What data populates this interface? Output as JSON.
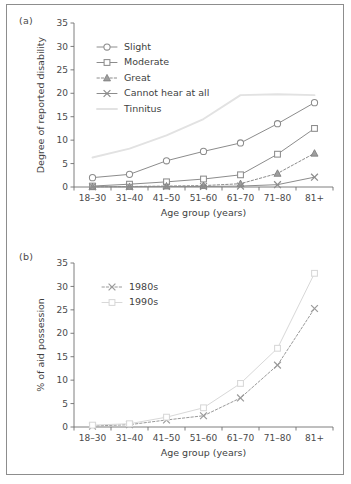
{
  "figure": {
    "panel_a_label": "(a)",
    "panel_b_label": "(b)"
  },
  "chart_data": [
    {
      "id": "panel-a",
      "type": "line",
      "title": "",
      "panel": "(a)",
      "xlabel": "Age group (years)",
      "ylabel": "Degree of reported disability",
      "categories": [
        "18–30",
        "31–40",
        "41–50",
        "51–60",
        "61–70",
        "71–80",
        "81+"
      ],
      "ylim": [
        0,
        35
      ],
      "yticks": [
        0,
        5,
        10,
        15,
        20,
        25,
        30,
        35
      ],
      "yticklabels": [
        "0",
        "5",
        "10",
        "15",
        "20",
        "25",
        "30",
        "35"
      ],
      "grid": false,
      "legend_position": "upper-left-inside",
      "series": [
        {
          "name": "Slight",
          "marker": "circle-open",
          "linestyle": "solid",
          "color": "#8c8c8c",
          "values": [
            2.0,
            2.7,
            5.6,
            7.6,
            9.4,
            13.5,
            18.0
          ]
        },
        {
          "name": "Moderate",
          "marker": "square-open",
          "linestyle": "solid",
          "color": "#8c8c8c",
          "values": [
            0.2,
            0.6,
            1.1,
            1.7,
            2.6,
            7.0,
            12.5
          ]
        },
        {
          "name": "Great",
          "marker": "triangle-filled",
          "linestyle": "dotted",
          "color": "#8c8c8c",
          "values": [
            0.05,
            0.1,
            0.2,
            0.3,
            0.7,
            2.9,
            7.2
          ]
        },
        {
          "name": "Cannot hear at all",
          "marker": "x",
          "linestyle": "solid",
          "color": "#8c8c8c",
          "values": [
            0.05,
            0.05,
            0.1,
            0.1,
            0.2,
            0.5,
            2.1
          ]
        },
        {
          "name": "Tinnitus",
          "marker": "none",
          "linestyle": "solid",
          "color": "#e2e2e2",
          "values": [
            6.3,
            8.2,
            11.0,
            14.5,
            19.6,
            19.8,
            19.6
          ]
        }
      ]
    },
    {
      "id": "panel-b",
      "type": "line",
      "title": "",
      "panel": "(b)",
      "xlabel": "Age group (years)",
      "ylabel": "% of aid possession",
      "categories": [
        "18–30",
        "31–40",
        "41–50",
        "51–60",
        "61–70",
        "71–80",
        "81+"
      ],
      "ylim": [
        0,
        35
      ],
      "yticks": [
        0,
        5,
        10,
        15,
        20,
        25,
        30,
        35
      ],
      "yticklabels": [
        "0",
        "5",
        "10",
        "15",
        "20",
        "25",
        "30",
        "35"
      ],
      "grid": false,
      "legend_position": "upper-left-inside",
      "series": [
        {
          "name": "1980s",
          "marker": "x",
          "linestyle": "dotted",
          "color": "#9a9a9a",
          "values": [
            0.2,
            0.5,
            1.5,
            2.4,
            6.2,
            13.2,
            25.3
          ]
        },
        {
          "name": "1990s",
          "marker": "square-open",
          "linestyle": "solid",
          "color": "#d8d8d8",
          "values": [
            0.4,
            0.7,
            2.1,
            4.1,
            9.3,
            16.8,
            32.8
          ]
        }
      ]
    }
  ]
}
